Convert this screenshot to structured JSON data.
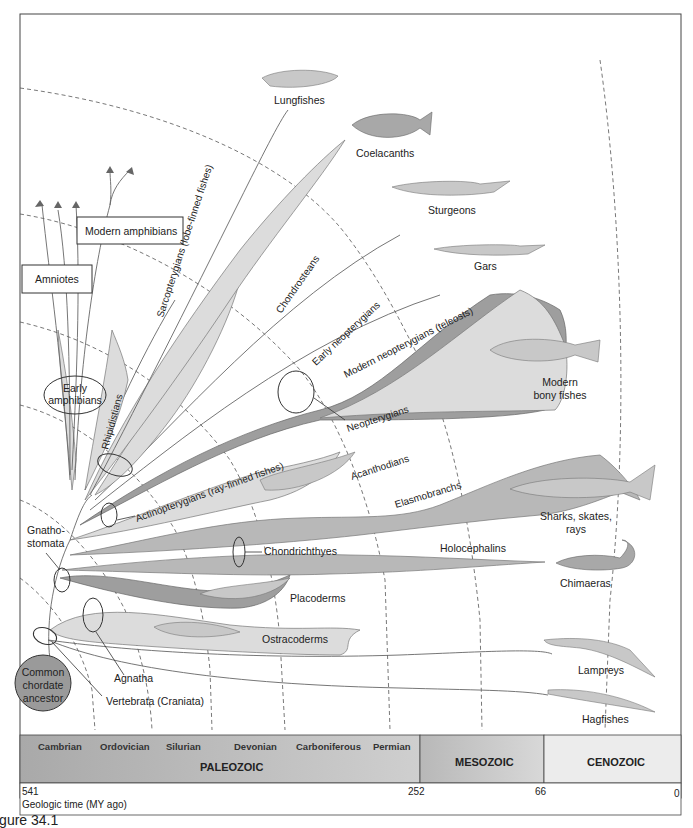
{
  "figure": {
    "caption": "igure 34.1"
  },
  "groups": {
    "lungfishes": "Lungfishes",
    "coelacanths": "Coelacanths",
    "sturgeons": "Sturgeons",
    "gars": "Gars",
    "modern_bony_fishes_1": "Modern",
    "modern_bony_fishes_2": "bony fishes",
    "sharks_1": "Sharks, skates,",
    "sharks_2": "rays",
    "chimaeras": "Chimaeras",
    "lampreys": "Lampreys",
    "hagfishes": "Hagfishes",
    "modern_amphibians": "Modern amphibians",
    "amniotes": "Amniotes",
    "early_amphibians_1": "Early",
    "early_amphibians_2": "amphibians",
    "common_ancestor_1": "Common",
    "common_ancestor_2": "chordate",
    "common_ancestor_3": "ancestor"
  },
  "clades": {
    "sarcopterygians": "Sarcopterygians (lobe-finned fishes)",
    "chondrosteans": "Chondrosteans",
    "early_neopterygians": "Early neopterygians",
    "modern_neopterygians": "Modern neopterygians (teleosts)",
    "neopterygians": "Neopterygians",
    "rhipidistians": "Rhipidistians",
    "actinopterygians": "Actinopterygians (ray-finned fishes)",
    "acanthodians": "Acanthodians",
    "elasmobranchs": "Elasmobranchs",
    "chondrichthyes": "Chondrichthyes",
    "holocephalins": "Holocephalins",
    "gnathostomata_1": "Gnatho-",
    "gnathostomata_2": "stomata",
    "placoderms": "Placoderms",
    "ostracoderms": "Ostracoderms",
    "agnatha": "Agnatha",
    "vertebrata": "Vertebrata (Craniata)"
  },
  "timeline": {
    "periods": [
      "Cambrian",
      "Ordovician",
      "Silurian",
      "Devonian",
      "Carboniferous",
      "Permian"
    ],
    "eras": [
      "PALEOZOIC",
      "MESOZOIC",
      "CENOZOIC"
    ],
    "ticks": [
      "541",
      "252",
      "66",
      "0"
    ],
    "axis_label": "Geologic time (MY ago)",
    "colors": {
      "paleozoic": "#b3b3b3",
      "mesozoic": "#c9c9c9",
      "cenozoic": "#ececec"
    }
  }
}
